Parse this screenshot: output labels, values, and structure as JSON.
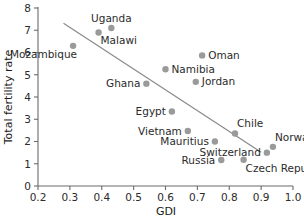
{
  "chart_data": {
    "type": "scatter",
    "title": "",
    "xlabel": "GDI",
    "ylabel": "Total fertility rate",
    "xlim": [
      0.2,
      1.0
    ],
    "ylim": [
      0,
      8
    ],
    "xticks": [
      "0.2",
      "0.3",
      "0.4",
      "0.5",
      "0.6",
      "0.7",
      "0.8",
      "0.9",
      "1.0"
    ],
    "xtick_values": [
      0.2,
      0.3,
      0.4,
      0.5,
      0.6,
      0.7,
      0.8,
      0.9,
      1.0
    ],
    "yticks": [
      "0",
      "1",
      "2",
      "3",
      "4",
      "5",
      "6",
      "7",
      "8"
    ],
    "ytick_values": [
      0,
      1,
      2,
      3,
      4,
      5,
      6,
      7,
      8
    ],
    "grid": false,
    "legend": false,
    "point_color": "#9a9a9a",
    "trend_line_color": "#8a8a8a",
    "axis_color": "#6b6b6b",
    "text_color": "#2b2b2b",
    "trend_line": {
      "x_start": 0.28,
      "y_start": 7.32,
      "x_end": 0.9,
      "y_end": 1.52
    },
    "points": [
      {
        "label": "Mozambique",
        "x": 0.31,
        "y": 6.3,
        "label_pos": "below-left"
      },
      {
        "label": "Malawi",
        "x": 0.39,
        "y": 6.9,
        "label_pos": "below-right"
      },
      {
        "label": "Uganda",
        "x": 0.43,
        "y": 7.1,
        "label_pos": "above"
      },
      {
        "label": "Ghana",
        "x": 0.54,
        "y": 4.6,
        "label_pos": "left"
      },
      {
        "label": "Namibia",
        "x": 0.6,
        "y": 5.25,
        "label_pos": "right"
      },
      {
        "label": "Egypt",
        "x": 0.62,
        "y": 3.35,
        "label_pos": "left"
      },
      {
        "label": "Vietnam",
        "x": 0.67,
        "y": 2.47,
        "label_pos": "left"
      },
      {
        "label": "Jordan",
        "x": 0.695,
        "y": 4.68,
        "label_pos": "right"
      },
      {
        "label": "Oman",
        "x": 0.715,
        "y": 5.87,
        "label_pos": "right"
      },
      {
        "label": "Mauritius",
        "x": 0.755,
        "y": 2.0,
        "label_pos": "left"
      },
      {
        "label": "Russia",
        "x": 0.775,
        "y": 1.17,
        "label_pos": "left"
      },
      {
        "label": "Chile",
        "x": 0.818,
        "y": 2.36,
        "label_pos": "above-right"
      },
      {
        "label": "Czech Republic",
        "x": 0.845,
        "y": 1.18,
        "label_pos": "below-right"
      },
      {
        "label": "Switzerland",
        "x": 0.918,
        "y": 1.5,
        "label_pos": "left"
      },
      {
        "label": "Norway",
        "x": 0.937,
        "y": 1.76,
        "label_pos": "above-right"
      }
    ]
  }
}
